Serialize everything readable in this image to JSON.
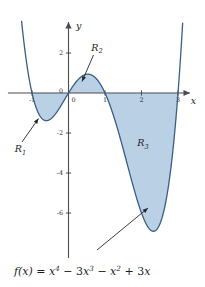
{
  "figure": {
    "title": "",
    "equation_text": "f(x) = x^4 - 3x^3 - x^2 + 3x",
    "equation_parts": {
      "fx": "f(x)",
      "equals": "=",
      "t1_base": "x",
      "t1_exp": "4",
      "minus1": "−",
      "t2_coef": "3",
      "t2_base": "x",
      "t2_exp": "3",
      "minus2": "−",
      "t3_base": "x",
      "t3_exp": "2",
      "plus1": "+",
      "t4_coef": "3",
      "t4_base": "x"
    },
    "axes": {
      "x_label": "x",
      "y_label": "y",
      "x_ticks": [
        {
          "value": -1,
          "label": "-1"
        },
        {
          "value": 0,
          "label": "0"
        },
        {
          "value": 1,
          "label": "1"
        },
        {
          "value": 2,
          "label": "2"
        },
        {
          "value": 3,
          "label": "3"
        }
      ],
      "y_ticks": [
        {
          "value": 2,
          "label": "2"
        },
        {
          "value": 0,
          "label": "0"
        },
        {
          "value": -2,
          "label": "-2"
        },
        {
          "value": -4,
          "label": "-4"
        },
        {
          "value": -6,
          "label": "-6"
        }
      ],
      "xlim": [
        -1.55,
        3.42
      ],
      "ylim": [
        -8.4,
        3.9
      ]
    },
    "regions": [
      {
        "id": "R1",
        "label": "R",
        "subscript": "1",
        "x_from": -1,
        "x_to": 0,
        "sign": "below"
      },
      {
        "id": "R2",
        "label": "R",
        "subscript": "2",
        "x_from": 0,
        "x_to": 1,
        "sign": "above"
      },
      {
        "id": "R3",
        "label": "R",
        "subscript": "3",
        "x_from": 1,
        "x_to": 3,
        "sign": "below"
      }
    ],
    "colors": {
      "fill": "#b6cde4",
      "curve": "#3a5d86",
      "axis": "#4a4a52",
      "text": "#1d1d24",
      "background": "#ffffff"
    }
  },
  "chart_data": {
    "type": "line",
    "title": "",
    "xlabel": "x",
    "ylabel": "y",
    "function": "f(x) = x^4 - 3x^3 - x^2 + 3x",
    "coefficients": {
      "x4": 1,
      "x3": -3,
      "x2": -1,
      "x1": 3,
      "x0": 0
    },
    "roots": [
      -1,
      0,
      1,
      3
    ],
    "xlim": [
      -1.55,
      3.42
    ],
    "ylim": [
      -8.4,
      3.9
    ],
    "xticks": [
      -1,
      0,
      1,
      2,
      3
    ],
    "yticks": [
      2,
      0,
      -2,
      -4,
      -6
    ],
    "grid": false,
    "legend": "none",
    "shaded_regions": [
      {
        "name": "R1",
        "interval": [
          -1,
          0
        ],
        "area_sign": "negative"
      },
      {
        "name": "R2",
        "interval": [
          0,
          1
        ],
        "area_sign": "positive"
      },
      {
        "name": "R3",
        "interval": [
          1,
          3
        ],
        "area_sign": "negative"
      }
    ],
    "annotations": [
      "R1",
      "R2",
      "R3",
      "f(x) = x^4 - 3x^3 - x^2 + 3x"
    ],
    "sample_points": [
      {
        "x": -1.5,
        "y": 16.3
      },
      {
        "x": -1.0,
        "y": 0
      },
      {
        "x": -0.5,
        "y": -1.3
      },
      {
        "x": 0.0,
        "y": 0
      },
      {
        "x": 0.5,
        "y": 1.0
      },
      {
        "x": 1.0,
        "y": 0
      },
      {
        "x": 1.5,
        "y": -3.6
      },
      {
        "x": 2.0,
        "y": -6.0
      },
      {
        "x": 2.36,
        "y": -7.5
      },
      {
        "x": 2.5,
        "y": -7.2
      },
      {
        "x": 3.0,
        "y": 0
      },
      {
        "x": 3.3,
        "y": 6.5
      }
    ]
  }
}
